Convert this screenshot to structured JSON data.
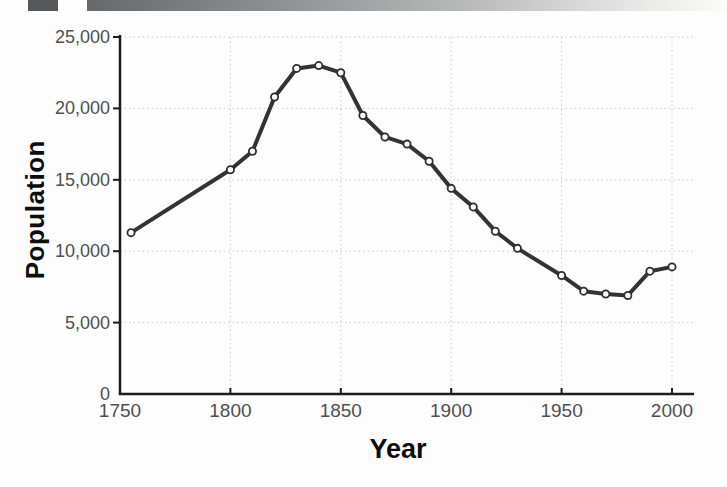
{
  "page": {
    "decorations": {
      "accent_square_color": "#57585a",
      "gradient_bar_from": "#67686b",
      "gradient_bar_to": "#fbfbfa"
    }
  },
  "chart_data": {
    "type": "line",
    "title": "",
    "xlabel": "Year",
    "ylabel": "Population",
    "series": [
      {
        "name": "population",
        "x": [
          1755,
          1800,
          1810,
          1820,
          1830,
          1840,
          1850,
          1860,
          1870,
          1880,
          1890,
          1900,
          1910,
          1920,
          1930,
          1950,
          1960,
          1970,
          1980,
          1990,
          2000
        ],
        "values": [
          11300,
          15700,
          17000,
          20800,
          22800,
          23000,
          22500,
          19500,
          18000,
          17500,
          16300,
          14400,
          13100,
          11400,
          10200,
          8300,
          7200,
          7000,
          6900,
          8600,
          8900
        ]
      }
    ],
    "xlim": [
      1750,
      2010
    ],
    "ylim": [
      0,
      25000
    ],
    "x_ticks": [
      1750,
      1800,
      1850,
      1900,
      1950,
      2000
    ],
    "y_ticks": [
      0,
      5000,
      10000,
      15000,
      20000,
      25000
    ],
    "y_tick_labels": [
      "0",
      "5,000",
      "10,000",
      "15,000",
      "20,000",
      "25,000"
    ],
    "grid": "dotted",
    "legend": "none",
    "marker": "open-circle",
    "colors": {
      "line": "#333333",
      "marker_fill": "#ffffff",
      "marker_stroke": "#2e2e2e",
      "gridline": "#c9c9c9",
      "axis": "#1c1c1c",
      "tick_label": "#4f4f4f",
      "axis_title": "#0d0d0d"
    }
  }
}
